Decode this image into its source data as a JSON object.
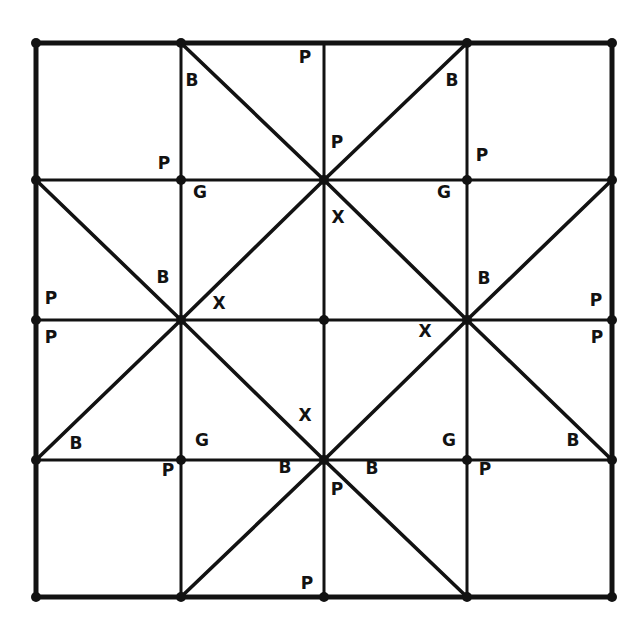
{
  "figure": {
    "background_color": "#ffffff",
    "ink_color": "#121212",
    "line_width_outer": 5,
    "line_width_grid": 3,
    "line_width_diagonal": 3.6,
    "node_radius": 5
  },
  "grid": {
    "columns": 4,
    "rows": 4,
    "x_lines": [
      36,
      181,
      324,
      467,
      612
    ],
    "y_lines": [
      43,
      180,
      320,
      460,
      597
    ]
  },
  "nodes": [
    {
      "name": "node-top-left",
      "x": 36,
      "y": 43,
      "dot": true
    },
    {
      "name": "node-top-c1",
      "x": 181,
      "y": 43,
      "dot": true
    },
    {
      "name": "node-top-c2",
      "x": 324,
      "y": 43,
      "dot": false
    },
    {
      "name": "node-top-c3",
      "x": 467,
      "y": 43,
      "dot": true
    },
    {
      "name": "node-top-right",
      "x": 612,
      "y": 43,
      "dot": true
    },
    {
      "name": "node-r1-left",
      "x": 36,
      "y": 180,
      "dot": true
    },
    {
      "name": "node-r1-c1",
      "x": 181,
      "y": 180,
      "dot": true
    },
    {
      "name": "node-r1-center",
      "x": 324,
      "y": 180,
      "dot": true
    },
    {
      "name": "node-r1-c3",
      "x": 467,
      "y": 180,
      "dot": true
    },
    {
      "name": "node-r1-right",
      "x": 612,
      "y": 180,
      "dot": true
    },
    {
      "name": "node-r2-left",
      "x": 36,
      "y": 320,
      "dot": true
    },
    {
      "name": "node-r2-c1",
      "x": 181,
      "y": 320,
      "dot": true
    },
    {
      "name": "node-center",
      "x": 324,
      "y": 320,
      "dot": true
    },
    {
      "name": "node-r2-c3",
      "x": 467,
      "y": 320,
      "dot": true
    },
    {
      "name": "node-r2-right",
      "x": 612,
      "y": 320,
      "dot": true
    },
    {
      "name": "node-r3-left",
      "x": 36,
      "y": 460,
      "dot": true
    },
    {
      "name": "node-r3-c1",
      "x": 181,
      "y": 460,
      "dot": true
    },
    {
      "name": "node-r3-center",
      "x": 324,
      "y": 460,
      "dot": true
    },
    {
      "name": "node-r3-c3",
      "x": 467,
      "y": 460,
      "dot": true
    },
    {
      "name": "node-r3-right",
      "x": 612,
      "y": 460,
      "dot": true
    },
    {
      "name": "node-bottom-left",
      "x": 36,
      "y": 597,
      "dot": true
    },
    {
      "name": "node-bottom-c1",
      "x": 181,
      "y": 597,
      "dot": true
    },
    {
      "name": "node-bottom-c2",
      "x": 324,
      "y": 597,
      "dot": true
    },
    {
      "name": "node-bottom-c3",
      "x": 467,
      "y": 597,
      "dot": true
    },
    {
      "name": "node-bottom-right",
      "x": 612,
      "y": 597,
      "dot": true
    }
  ],
  "outer_border": {
    "x": 36,
    "y": 43,
    "width": 576,
    "height": 554
  },
  "grid_lines": [
    {
      "name": "grid-v-1",
      "x1": 181,
      "y1": 43,
      "x2": 181,
      "y2": 597
    },
    {
      "name": "grid-v-2",
      "x1": 324,
      "y1": 43,
      "x2": 324,
      "y2": 597
    },
    {
      "name": "grid-v-3",
      "x1": 467,
      "y1": 43,
      "x2": 467,
      "y2": 597
    },
    {
      "name": "grid-h-1",
      "x1": 36,
      "y1": 180,
      "x2": 612,
      "y2": 180
    },
    {
      "name": "grid-h-2",
      "x1": 36,
      "y1": 320,
      "x2": 612,
      "y2": 320
    },
    {
      "name": "grid-h-3",
      "x1": 36,
      "y1": 460,
      "x2": 612,
      "y2": 460
    }
  ],
  "diagonals": [
    {
      "name": "diag-tl-down-right-upper",
      "x1": 181,
      "y1": 43,
      "x2": 324,
      "y2": 180
    },
    {
      "name": "diag-tr-down-left-upper",
      "x1": 467,
      "y1": 43,
      "x2": 324,
      "y2": 180
    },
    {
      "name": "diag-left-up-right",
      "x1": 36,
      "y1": 180,
      "x2": 181,
      "y2": 320
    },
    {
      "name": "diag-c1-up-right",
      "x1": 181,
      "y1": 320,
      "x2": 324,
      "y2": 180
    },
    {
      "name": "diag-center-up-right",
      "x1": 324,
      "y1": 180,
      "x2": 467,
      "y2": 320
    },
    {
      "name": "diag-c3-up-right",
      "x1": 467,
      "y1": 320,
      "x2": 612,
      "y2": 180
    },
    {
      "name": "diag-left-down-right",
      "x1": 36,
      "y1": 460,
      "x2": 181,
      "y2": 320
    },
    {
      "name": "diag-c1-down-right",
      "x1": 181,
      "y1": 320,
      "x2": 324,
      "y2": 460
    },
    {
      "name": "diag-center-down-right",
      "x1": 324,
      "y1": 460,
      "x2": 467,
      "y2": 320
    },
    {
      "name": "diag-c3-down-right",
      "x1": 467,
      "y1": 320,
      "x2": 612,
      "y2": 460
    },
    {
      "name": "diag-bl-up-right-lower",
      "x1": 181,
      "y1": 597,
      "x2": 324,
      "y2": 460
    },
    {
      "name": "diag-br-up-left-lower",
      "x1": 467,
      "y1": 597,
      "x2": 324,
      "y2": 460
    }
  ],
  "labels": [
    {
      "name": "label-b-top-left",
      "text": "B",
      "x": 192,
      "y": 81
    },
    {
      "name": "label-p-top-mid",
      "text": "P",
      "x": 305,
      "y": 58
    },
    {
      "name": "label-b-top-right",
      "text": "B",
      "x": 452,
      "y": 81
    },
    {
      "name": "label-p-center-upper",
      "text": "P",
      "x": 337,
      "y": 143
    },
    {
      "name": "label-p-row1-left",
      "text": "P",
      "x": 164,
      "y": 164
    },
    {
      "name": "label-p-row1-right",
      "text": "P",
      "x": 482,
      "y": 156
    },
    {
      "name": "label-g-row1-left",
      "text": "G",
      "x": 200,
      "y": 193
    },
    {
      "name": "label-g-row1-right",
      "text": "G",
      "x": 444,
      "y": 193
    },
    {
      "name": "label-x-upper-center",
      "text": "X",
      "x": 338,
      "y": 218
    },
    {
      "name": "label-b-mid-left",
      "text": "B",
      "x": 163,
      "y": 278
    },
    {
      "name": "label-b-mid-right",
      "text": "B",
      "x": 484,
      "y": 279
    },
    {
      "name": "label-p-left-upper",
      "text": "P",
      "x": 51,
      "y": 299
    },
    {
      "name": "label-p-right-upper",
      "text": "P",
      "x": 596,
      "y": 301
    },
    {
      "name": "label-x-left-center",
      "text": "X",
      "x": 219,
      "y": 304
    },
    {
      "name": "label-p-left-lower",
      "text": "P",
      "x": 51,
      "y": 338
    },
    {
      "name": "label-p-right-lower",
      "text": "P",
      "x": 597,
      "y": 338
    },
    {
      "name": "label-x-right-center",
      "text": "X",
      "x": 425,
      "y": 332
    },
    {
      "name": "label-x-lower-center",
      "text": "X",
      "x": 305,
      "y": 416
    },
    {
      "name": "label-b-row3-left",
      "text": "B",
      "x": 76,
      "y": 444
    },
    {
      "name": "label-g-row3-left",
      "text": "G",
      "x": 202,
      "y": 441
    },
    {
      "name": "label-g-row3-right",
      "text": "G",
      "x": 449,
      "y": 441
    },
    {
      "name": "label-b-row3-right",
      "text": "B",
      "x": 573,
      "y": 441
    },
    {
      "name": "label-p-row3-left",
      "text": "P",
      "x": 168,
      "y": 471
    },
    {
      "name": "label-b-bottom-left",
      "text": "B",
      "x": 285,
      "y": 468
    },
    {
      "name": "label-b-bottom-right",
      "text": "B",
      "x": 372,
      "y": 469
    },
    {
      "name": "label-p-row3-right",
      "text": "P",
      "x": 485,
      "y": 470
    },
    {
      "name": "label-p-bottom-center",
      "text": "P",
      "x": 337,
      "y": 490
    },
    {
      "name": "label-p-bottom-edge",
      "text": "P",
      "x": 307,
      "y": 584
    }
  ],
  "legend": {
    "symbols": [
      "P",
      "B",
      "G",
      "X"
    ],
    "counts": {
      "P": 13,
      "B": 8,
      "G": 4,
      "X": 4
    }
  }
}
